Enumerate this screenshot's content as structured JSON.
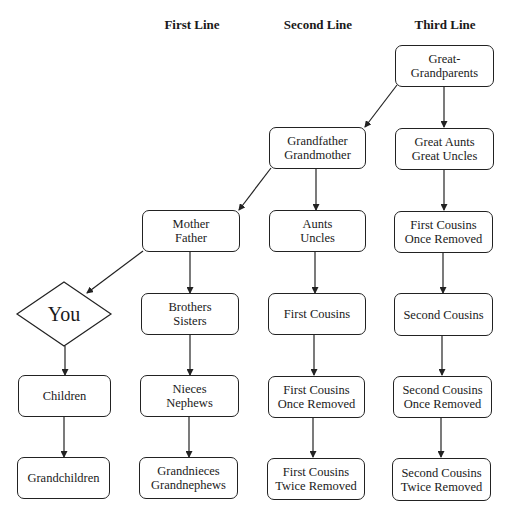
{
  "column_headers": [
    "First Line",
    "Second Line",
    "Third Line"
  ],
  "self_node": {
    "label": "You"
  },
  "nodes": {
    "great_grandparents": "Great-\nGrandparents",
    "grandparents": "Grandfather\nGrandmother",
    "great_aunts_uncles": "Great Aunts\nGreat Uncles",
    "parents": "Mother\nFather",
    "aunts_uncles": "Aunts\nUncles",
    "first_cousins_once_removed_up": "First Cousins\nOnce Removed",
    "siblings": "Brothers\nSisters",
    "first_cousins": "First Cousins",
    "second_cousins": "Second Cousins",
    "children": "Children",
    "nieces_nephews": "Nieces\nNephews",
    "first_cousins_once_removed_down": "First Cousins\nOnce Removed",
    "second_cousins_once_removed": "Second Cousins\nOnce Removed",
    "grandchildren": "Grandchildren",
    "grandnieces_grandnephews": "Grandnieces\nGrandnephews",
    "first_cousins_twice_removed": "First Cousins\nTwice Removed",
    "second_cousins_twice_removed": "Second Cousins\nTwice Removed"
  },
  "edges": [
    [
      "great_grandparents",
      "grandparents"
    ],
    [
      "great_grandparents",
      "great_aunts_uncles"
    ],
    [
      "grandparents",
      "parents"
    ],
    [
      "grandparents",
      "aunts_uncles"
    ],
    [
      "great_aunts_uncles",
      "first_cousins_once_removed_up"
    ],
    [
      "parents",
      "you"
    ],
    [
      "parents",
      "siblings"
    ],
    [
      "aunts_uncles",
      "first_cousins"
    ],
    [
      "first_cousins_once_removed_up",
      "second_cousins"
    ],
    [
      "you",
      "children"
    ],
    [
      "siblings",
      "nieces_nephews"
    ],
    [
      "first_cousins",
      "first_cousins_once_removed_down"
    ],
    [
      "second_cousins",
      "second_cousins_once_removed"
    ],
    [
      "children",
      "grandchildren"
    ],
    [
      "nieces_nephews",
      "grandnieces_grandnephews"
    ],
    [
      "first_cousins_once_removed_down",
      "first_cousins_twice_removed"
    ],
    [
      "second_cousins_once_removed",
      "second_cousins_twice_removed"
    ]
  ]
}
